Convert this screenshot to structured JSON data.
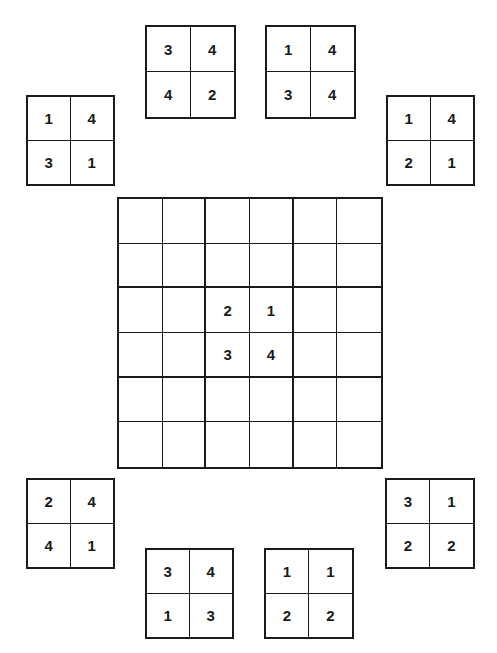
{
  "puzzle": {
    "type": "4-tile jigsaw sudoku",
    "board": {
      "rows": 6,
      "cols": 6,
      "cells": [
        [
          "",
          "",
          "",
          "",
          "",
          ""
        ],
        [
          "",
          "",
          "",
          "",
          "",
          ""
        ],
        [
          "",
          "",
          "2",
          "1",
          "",
          ""
        ],
        [
          "",
          "",
          "3",
          "4",
          "",
          ""
        ],
        [
          "",
          "",
          "",
          "",
          "",
          ""
        ],
        [
          "",
          "",
          "",
          "",
          "",
          ""
        ]
      ]
    },
    "tiles": [
      {
        "id": "top-left",
        "values": [
          "3",
          "4",
          "4",
          "2"
        ]
      },
      {
        "id": "top-right",
        "values": [
          "1",
          "4",
          "3",
          "4"
        ]
      },
      {
        "id": "mid-left",
        "values": [
          "1",
          "4",
          "3",
          "1"
        ]
      },
      {
        "id": "mid-right",
        "values": [
          "1",
          "4",
          "2",
          "1"
        ]
      },
      {
        "id": "lower-left",
        "values": [
          "2",
          "4",
          "4",
          "1"
        ]
      },
      {
        "id": "lower-right",
        "values": [
          "3",
          "1",
          "2",
          "2"
        ]
      },
      {
        "id": "bottom-left",
        "values": [
          "3",
          "4",
          "1",
          "3"
        ]
      },
      {
        "id": "bottom-right",
        "values": [
          "1",
          "1",
          "2",
          "2"
        ]
      }
    ]
  }
}
